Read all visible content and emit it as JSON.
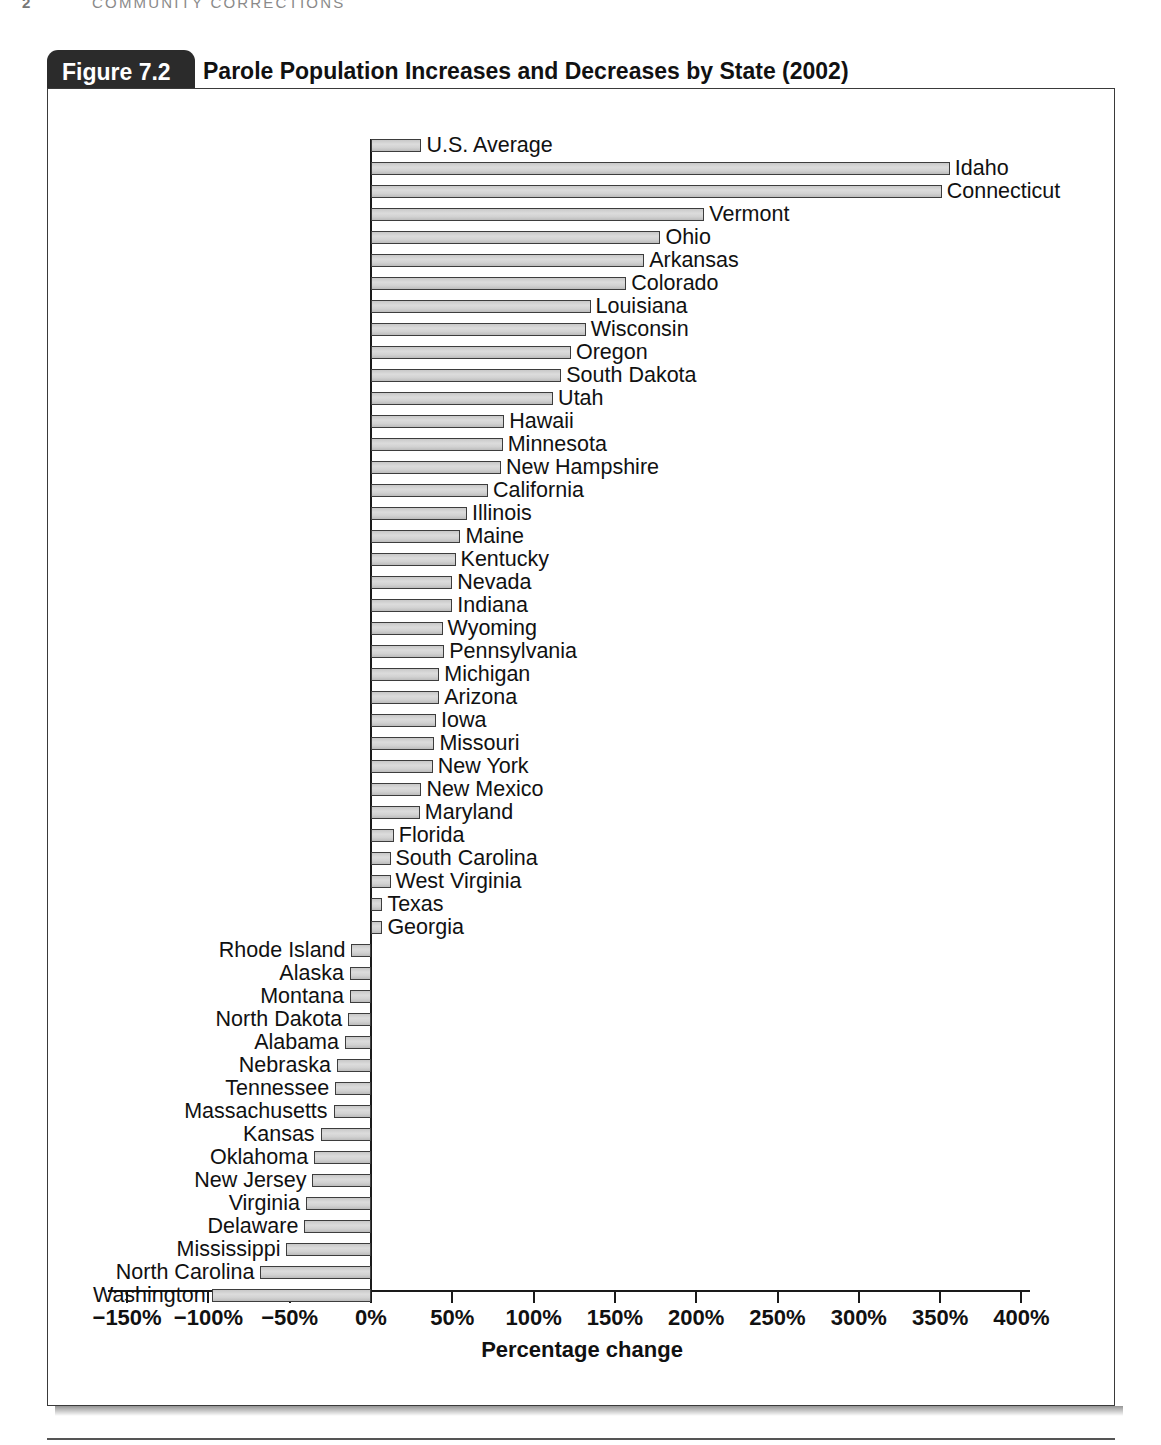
{
  "running_head": {
    "page_number": "2",
    "title": "COMMUNITY CORRECTIONS"
  },
  "figure": {
    "tab_label": "Figure 7.2",
    "title": "Parole Population Increases and Decreases by State (2002)"
  },
  "chart_data": {
    "type": "bar",
    "orientation": "horizontal",
    "title": "Parole Population Increases and Decreases by State (2002)",
    "xlabel": "Percentage change",
    "ylabel": "",
    "xlim": [
      -150,
      400
    ],
    "xticks": [
      -150,
      -100,
      -50,
      0,
      50,
      100,
      150,
      200,
      250,
      300,
      350,
      400
    ],
    "xticklabels": [
      "−150%",
      "−100%",
      "−50%",
      "0%",
      "50%",
      "100%",
      "150%",
      "200%",
      "250%",
      "300%",
      "350%",
      "400%"
    ],
    "grid": false,
    "legend": null,
    "categories": [
      "U.S. Average",
      "Idaho",
      "Connecticut",
      "Vermont",
      "Ohio",
      "Arkansas",
      "Colorado",
      "Louisiana",
      "Wisconsin",
      "Oregon",
      "South Dakota",
      "Utah",
      "Hawaii",
      "Minnesota",
      "New Hampshire",
      "California",
      "Illinois",
      "Maine",
      "Kentucky",
      "Nevada",
      "Indiana",
      "Wyoming",
      "Pennsylvania",
      "Michigan",
      "Arizona",
      "Iowa",
      "Missouri",
      "New York",
      "New Mexico",
      "Maryland",
      "Florida",
      "South Carolina",
      "West Virginia",
      "Texas",
      "Georgia",
      "Rhode Island",
      "Alaska",
      "Montana",
      "North Dakota",
      "Alabama",
      "Nebraska",
      "Tennessee",
      "Massachusetts",
      "Kansas",
      "Oklahoma",
      "New Jersey",
      "Virginia",
      "Delaware",
      "Mississippi",
      "North Carolina",
      "Washington"
    ],
    "values": [
      31,
      356,
      351,
      205,
      178,
      168,
      157,
      135,
      132,
      123,
      117,
      112,
      82,
      81,
      80,
      72,
      59,
      55,
      52,
      50,
      50,
      44,
      45,
      42,
      42,
      40,
      39,
      38,
      31,
      30,
      14,
      12,
      12,
      7,
      7,
      -12,
      -13,
      -13,
      -14,
      -16,
      -21,
      -22,
      -23,
      -31,
      -35,
      -36,
      -40,
      -41,
      -52,
      -68,
      -98
    ]
  }
}
